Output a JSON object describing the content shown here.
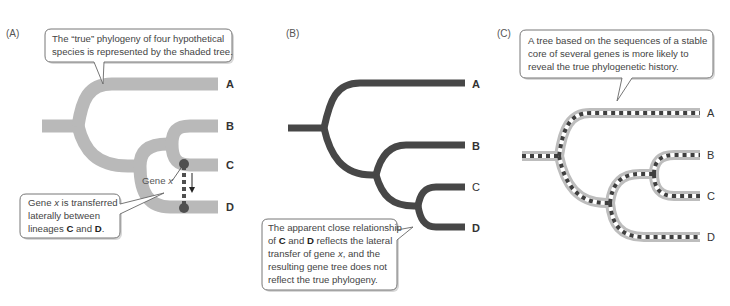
{
  "figure": {
    "panels": [
      {
        "id": "A",
        "label": "(A)",
        "tree_style": "shaded",
        "leaves": [
          "A",
          "B",
          "C",
          "D"
        ],
        "topology": "(A,(B,(C... true: ((B,C),D)))",
        "callouts": {
          "top": {
            "lines": [
              "The “true” phylogeny of four hypothetical",
              "species is represented by the shaded tree."
            ]
          },
          "bottom": {
            "line1": "Gene ",
            "line1_italic": "x",
            "line1_rest": " is transferred",
            "line2": "laterally between",
            "line3_pre": "lineages ",
            "line3_b1": "C",
            "line3_mid": " and ",
            "line3_b2": "D",
            "line3_post": "."
          }
        },
        "gene_label": "Gene ",
        "gene_label_italic": "x"
      },
      {
        "id": "B",
        "label": "(B)",
        "tree_style": "dark",
        "leaves": [
          "A",
          "B",
          "C",
          "D"
        ],
        "callout": {
          "l1": "The apparent close relationship",
          "l2_pre": "of ",
          "l2_b1": "C",
          "l2_mid": " and ",
          "l2_b2": "D",
          "l2_post": " reflects the lateral",
          "l3_pre": "transfer of gene ",
          "l3_italic": "x",
          "l3_post": ", and the",
          "l4": "resulting gene tree does not",
          "l5": "reflect the true phylogeny."
        }
      },
      {
        "id": "C",
        "label": "(C)",
        "tree_style": "shaded-with-dashed-core",
        "leaves": [
          "A",
          "B",
          "C",
          "D"
        ],
        "callout": {
          "lines": [
            "A tree based on the sequences of a stable",
            "core of several genes is more likely to",
            "reveal the true phylogenetic history."
          ]
        }
      }
    ],
    "colors": {
      "shaded_branch": "#b9b9b9",
      "dark_branch": "#474747",
      "dot": "#4f4f4f",
      "core_dash": "#3f3f3f"
    }
  }
}
